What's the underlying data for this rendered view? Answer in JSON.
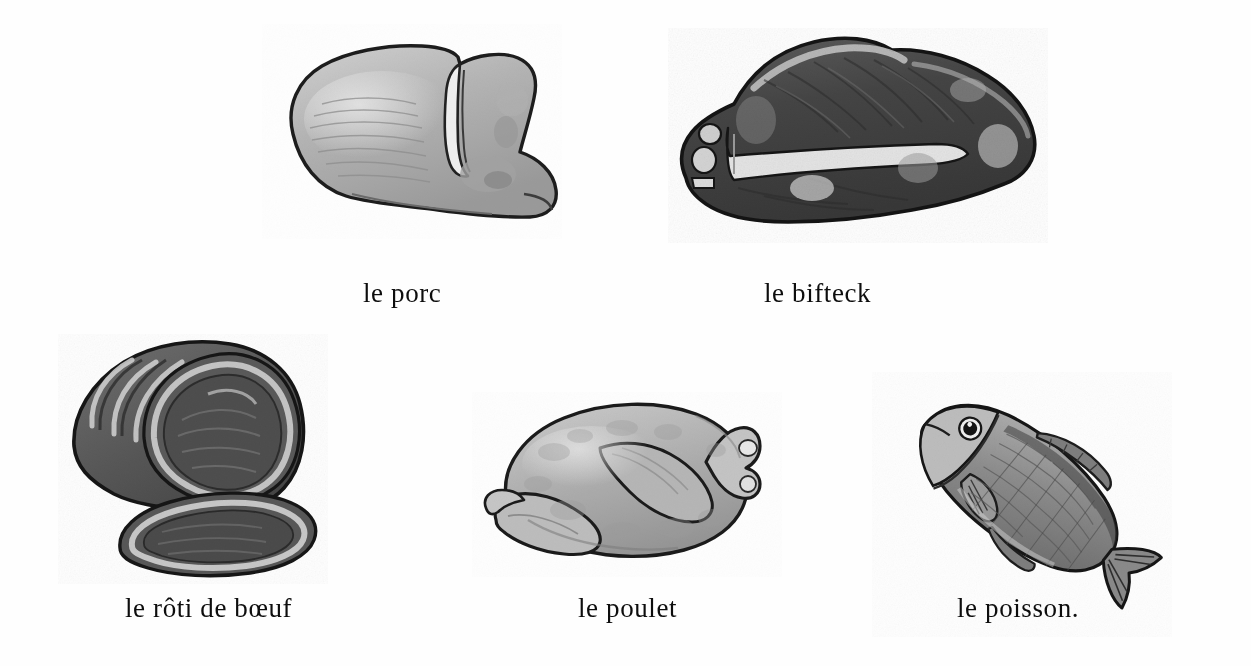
{
  "page": {
    "background_color": "#fefefe",
    "text_color": "#0d0d0d",
    "kind": "illustrated vocabulary plate"
  },
  "items": [
    {
      "id": "porc",
      "caption": "le porc",
      "icon_name": "pork-chop-illustration",
      "tone": "light-gray",
      "fill": "#b9b9b9",
      "outline": "#1d1d1d",
      "row": 1,
      "column": 1
    },
    {
      "id": "bifteck",
      "caption": "le bifteck",
      "icon_name": "t-bone-steak-illustration",
      "tone": "dark-gray",
      "fill": "#4c4c4c",
      "outline": "#141414",
      "row": 1,
      "column": 2
    },
    {
      "id": "roti",
      "caption": "le rôti de bœuf",
      "icon_name": "roast-beef-illustration",
      "tone": "medium-dark-gray",
      "fill": "#5d5d5d",
      "outline": "#161616",
      "row": 2,
      "column": 1
    },
    {
      "id": "poulet",
      "caption": "le poulet",
      "icon_name": "whole-chicken-illustration",
      "tone": "light-gray",
      "fill": "#bdbdbd",
      "outline": "#1b1b1b",
      "row": 2,
      "column": 2
    },
    {
      "id": "poisson",
      "caption": "le poisson.",
      "icon_name": "fish-illustration",
      "tone": "medium-gray",
      "fill": "#8d8d8d",
      "outline": "#161616",
      "row": 2,
      "column": 3
    }
  ]
}
